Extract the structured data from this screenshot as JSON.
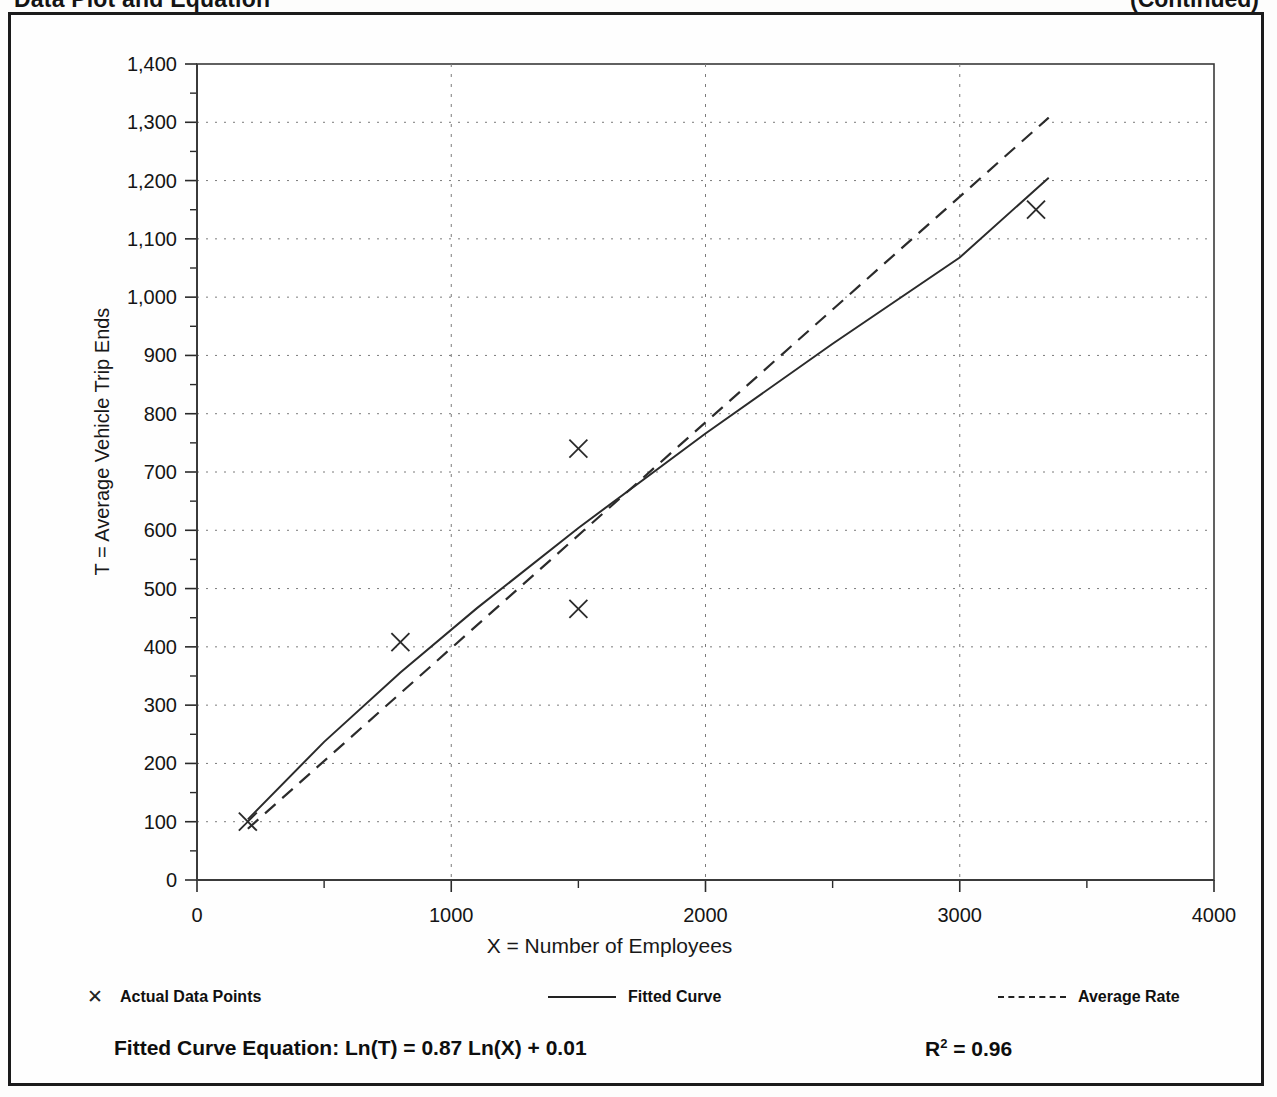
{
  "page": {
    "heading_left": "Data Plot and Equation",
    "heading_right": "(Continued)"
  },
  "legend": {
    "items": [
      {
        "label": "Actual Data Points",
        "marker": "x-marker-icon"
      },
      {
        "label": "Fitted Curve",
        "marker": "solid-line-icon"
      },
      {
        "label": "Average Rate",
        "marker": "dashed-line-icon"
      }
    ]
  },
  "footer": {
    "equation_label": "Fitted Curve Equation:",
    "equation": "Ln(T) = 0.87 Ln(X) + 0.01",
    "equation_full": "Fitted Curve Equation:  Ln(T) = 0.87 Ln(X) + 0.01",
    "r2_symbol": "R",
    "r2_exponent": "2",
    "r2_value": "= 0.96",
    "r2_full": "R2 = 0.96"
  },
  "chart_data": {
    "type": "scatter",
    "title": "Data Plot and Equation",
    "xlabel": "X = Number of Employees",
    "ylabel": "T = Average Vehicle Trip Ends",
    "xlim": [
      0,
      4000
    ],
    "ylim": [
      0,
      1400
    ],
    "xticks": [
      0,
      1000,
      2000,
      3000,
      4000
    ],
    "xtick_labels": [
      "0",
      "1000",
      "2000",
      "3000",
      "4000"
    ],
    "xminor_ticks": [
      500,
      1500,
      2500,
      3500
    ],
    "yticks": [
      0,
      100,
      200,
      300,
      400,
      500,
      600,
      700,
      800,
      900,
      1000,
      1100,
      1200,
      1300,
      1400
    ],
    "ytick_labels": [
      "0",
      "100",
      "200",
      "300",
      "400",
      "500",
      "600",
      "700",
      "800",
      "900",
      "1,000",
      "1,100",
      "1,200",
      "1,300",
      "1,400"
    ],
    "yminor_ticks": [
      50,
      150,
      250,
      350,
      450,
      550,
      650,
      750,
      850,
      950,
      1050,
      1150,
      1250,
      1350
    ],
    "grid": "dotted-major-xy",
    "legend_position": "below-axes",
    "series": [
      {
        "name": "Actual Data Points",
        "type": "scatter",
        "marker": "x",
        "points": [
          {
            "x": 200,
            "y": 100
          },
          {
            "x": 800,
            "y": 408
          },
          {
            "x": 1500,
            "y": 740
          },
          {
            "x": 1500,
            "y": 465
          },
          {
            "x": 3300,
            "y": 1150
          }
        ]
      },
      {
        "name": "Fitted Curve",
        "type": "line",
        "style": "solid",
        "equation": "Ln(T) = 0.87 Ln(X) + 0.01",
        "points": [
          {
            "x": 200,
            "y": 104
          },
          {
            "x": 500,
            "y": 237
          },
          {
            "x": 800,
            "y": 356
          },
          {
            "x": 1100,
            "y": 466
          },
          {
            "x": 1500,
            "y": 604
          },
          {
            "x": 2000,
            "y": 766
          },
          {
            "x": 2500,
            "y": 920
          },
          {
            "x": 3000,
            "y": 1068
          },
          {
            "x": 3350,
            "y": 1205
          }
        ]
      },
      {
        "name": "Average Rate",
        "type": "line",
        "style": "dashed",
        "points": [
          {
            "x": 200,
            "y": 88
          },
          {
            "x": 3350,
            "y": 1308
          }
        ]
      }
    ],
    "annotations": [
      {
        "text": "Fitted Curve Equation:  Ln(T) = 0.87 Ln(X) + 0.01",
        "position": "bottom-left"
      },
      {
        "text": "R2 = 0.96",
        "position": "bottom-right"
      }
    ]
  }
}
